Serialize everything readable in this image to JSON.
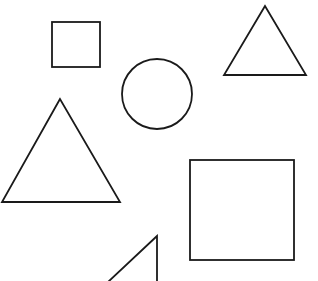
{
  "canvas": {
    "width": 318,
    "height": 281,
    "background": "#ffffff",
    "stroke": "#1a1a1a"
  },
  "shapes": {
    "small_square": {
      "type": "square",
      "x": 52,
      "y": 22,
      "w": 48,
      "h": 45
    },
    "circle": {
      "type": "circle",
      "cx": 157,
      "cy": 94,
      "r": 35
    },
    "top_right_triangle": {
      "type": "triangle",
      "points": "265,6 224,75 306,75"
    },
    "large_triangle": {
      "type": "triangle",
      "points": "60,99 2,202 120,202"
    },
    "large_square": {
      "type": "square",
      "x": 190,
      "y": 160,
      "w": 104,
      "h": 100
    },
    "bottom_triangle": {
      "type": "triangle",
      "points": "157,236 108,282 157,282"
    }
  }
}
